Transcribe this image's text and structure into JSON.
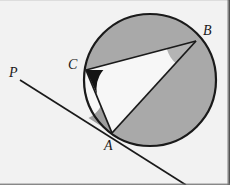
{
  "figure": {
    "kind": "circle-geometry-diagram",
    "background_color": "#f2f2f2",
    "stroke_color": "#1a1a1a",
    "segment_fill": "#a9a9a9",
    "angle_wedge_dark": "#141414",
    "angle_wedge_gray": "#b4b4b4",
    "angle_wedge_light": "#9e9e9e",
    "interior_fill": "#f7f7f7"
  },
  "circle": {
    "center_x": 150,
    "center_y": 80,
    "radius": 66,
    "stroke_width": 2
  },
  "points": {
    "A": {
      "label": "A",
      "x": 112,
      "y": 133,
      "label_x": 104,
      "label_y": 139
    },
    "B": {
      "label": "B",
      "x": 196,
      "y": 41,
      "label_x": 203,
      "label_y": 24
    },
    "C": {
      "label": "C",
      "x": 86,
      "y": 70,
      "label_x": 68,
      "label_y": 58
    },
    "P": {
      "label": "P",
      "x": 22,
      "y": 82,
      "label_x": 9,
      "label_y": 66
    }
  },
  "lines": {
    "secant_PA": {
      "from": "P",
      "through": "A",
      "x1": 20,
      "y1": 80,
      "x2": 186,
      "y2": 185
    },
    "chord_CB": {
      "x1": 86,
      "y1": 70,
      "x2": 196,
      "y2": 41
    },
    "chord_CA": {
      "x1": 86,
      "y1": 70,
      "x2": 112,
      "y2": 133
    },
    "chord_AB": {
      "x1": 112,
      "y1": 133,
      "x2": 196,
      "y2": 41
    }
  },
  "angles": {
    "at_C": {
      "vertex": "C",
      "shade": "dark",
      "between": [
        "CB",
        "CA"
      ]
    },
    "at_B": {
      "vertex": "B",
      "shade": "gray",
      "between": [
        "BC",
        "BA"
      ]
    },
    "at_A": {
      "vertex": "A",
      "shade": "light",
      "between": [
        "AP",
        "AC"
      ]
    }
  },
  "shaded_regions": [
    {
      "name": "major-segment-above-CB",
      "chord": "CB"
    },
    {
      "name": "segment-below-AB",
      "chord": "AB"
    }
  ]
}
